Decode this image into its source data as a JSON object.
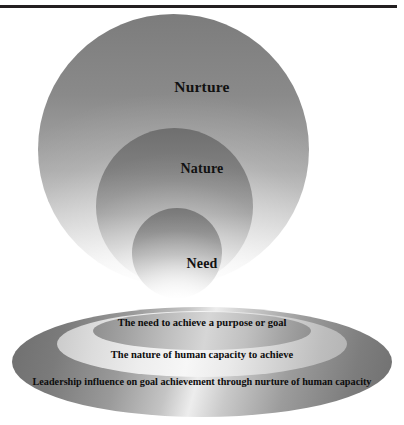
{
  "figure": {
    "top_rule": "horizontal-rule",
    "circles": [
      {
        "key": "nurture",
        "label": "Nurture"
      },
      {
        "key": "nature",
        "label": "Nature"
      },
      {
        "key": "need",
        "label": "Need"
      }
    ],
    "ellipses": [
      {
        "key": "inner",
        "label": "The need to achieve a purpose or goal"
      },
      {
        "key": "middle",
        "label": "The nature of human capacity to achieve"
      },
      {
        "key": "outer",
        "label": "Leadership influence on goal achievement through nurture of human capacity"
      }
    ],
    "colors": {
      "rule": "#231f20",
      "text": "#0d0d0d",
      "background": "#ffffff",
      "gray_dark": "#6e6e6e",
      "gray_mid": "#a9a9a9",
      "gray_light": "#ededed"
    }
  }
}
